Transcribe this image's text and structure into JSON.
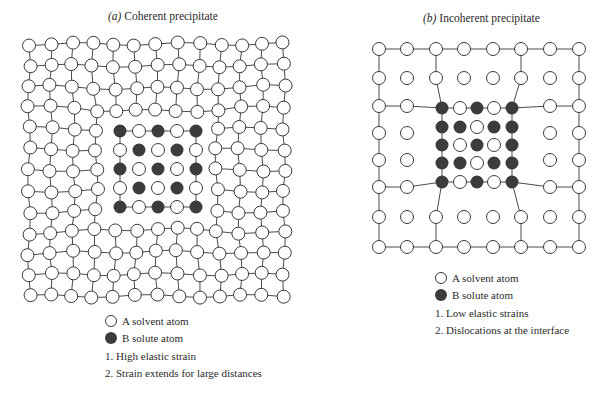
{
  "colors": {
    "line": "#4a4a4a",
    "solvent_fill": "#ffffff",
    "solvent_stroke": "#3a3a3a",
    "solute_fill": "#3c3c3c",
    "text": "#2a2a2a"
  },
  "panels": {
    "a": {
      "label": "(a)",
      "title": "Coherent precipitate",
      "legend": {
        "solvent": "A  solvent atom",
        "solute": "B  solute atom",
        "notes": [
          "1. High elastic strain",
          "2. Strain extends for large distances"
        ]
      },
      "lattice": {
        "cols": 13,
        "rows": 13,
        "x0": 29,
        "dx": 21.25,
        "y0": 44,
        "dy": 21,
        "atom_radius": 6.5,
        "precipitate": {
          "center": [
            158,
            169
          ],
          "spacing": 19,
          "pattern": [
            [
              "B",
              "A",
              "B",
              "A",
              "B"
            ],
            [
              "A",
              "B",
              "A",
              "B",
              "A"
            ],
            [
              "B",
              "A",
              "B",
              "A",
              "B"
            ],
            [
              "A",
              "B",
              "A",
              "B",
              "A"
            ],
            [
              "B",
              "A",
              "B",
              "A",
              "B"
            ]
          ]
        }
      }
    },
    "b": {
      "label": "(b)",
      "title": "Incoherent precipitate",
      "legend": {
        "solvent": "A  solvent atom",
        "solute": "B  solute atom",
        "notes": [
          "1. Low elastic strains",
          "2. Dislocations at the interface"
        ]
      },
      "lattice": {
        "atom_radius": 6.5,
        "xs": [
          379,
          407,
          436,
          464,
          493,
          521,
          550,
          579
        ],
        "ys": [
          49,
          78,
          106,
          133,
          160,
          187,
          217,
          247
        ],
        "precipitate": {
          "xs": [
            442,
            460,
            477,
            494,
            512
          ],
          "ys": [
            108,
            127,
            145,
            163,
            182
          ],
          "pattern": [
            [
              "B",
              "A",
              "B",
              "A",
              "B"
            ],
            [
              "B",
              "B",
              "A",
              "B",
              "B"
            ],
            [
              "B",
              "A",
              "B",
              "A",
              "B"
            ],
            [
              "B",
              "B",
              "A",
              "B",
              "B"
            ],
            [
              "B",
              "A",
              "B",
              "A",
              "B"
            ]
          ]
        }
      }
    }
  }
}
